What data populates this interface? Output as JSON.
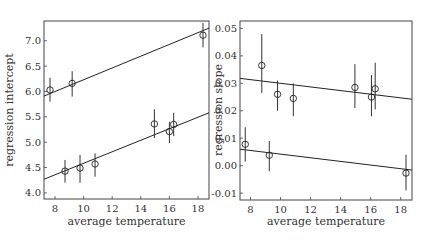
{
  "chart_data": [
    {
      "type": "scatter",
      "title": "",
      "xlabel": "average temperature",
      "ylabel": "regression intercept",
      "xlim": [
        7.23,
        18.77
      ],
      "ylim": [
        3.88,
        7.39
      ],
      "xticks": [
        8,
        10,
        12,
        14,
        16,
        18
      ],
      "yticks": [
        4.0,
        4.5,
        5.0,
        5.5,
        6.0,
        6.5,
        7.0
      ],
      "ytick_labels": [
        "4.0",
        "4.5",
        "5.0",
        "5.5",
        "6.0",
        "6.5",
        "7.0"
      ],
      "grid": false,
      "legend": null,
      "series": [
        {
          "name": "upper group",
          "points": [
            {
              "x": 7.65,
              "y": 6.03,
              "lo": 5.8,
              "hi": 6.27
            },
            {
              "x": 9.2,
              "y": 6.16,
              "lo": 5.9,
              "hi": 6.4
            },
            {
              "x": 18.35,
              "y": 7.11,
              "lo": 6.87,
              "hi": 7.35
            }
          ],
          "fit_line": {
            "x": [
              7.23,
              18.77
            ],
            "y": [
              5.91,
              7.25
            ]
          }
        },
        {
          "name": "lower group",
          "points": [
            {
              "x": 8.7,
              "y": 4.43,
              "lo": 4.2,
              "hi": 4.65
            },
            {
              "x": 9.75,
              "y": 4.49,
              "lo": 4.2,
              "hi": 4.75
            },
            {
              "x": 10.8,
              "y": 4.57,
              "lo": 4.32,
              "hi": 4.78
            },
            {
              "x": 14.95,
              "y": 5.36,
              "lo": 5.08,
              "hi": 5.65
            },
            {
              "x": 16.0,
              "y": 5.21,
              "lo": 4.98,
              "hi": 5.4
            },
            {
              "x": 16.3,
              "y": 5.35,
              "lo": 5.12,
              "hi": 5.58
            }
          ],
          "fit_line": {
            "x": [
              7.23,
              18.77
            ],
            "y": [
              4.27,
              5.58
            ]
          }
        }
      ]
    },
    {
      "type": "scatter",
      "title": "",
      "xlabel": "average temperature",
      "ylabel": "regression slope",
      "xlim": [
        7.3,
        18.75
      ],
      "ylim": [
        -0.0125,
        0.0527
      ],
      "xticks": [
        8,
        10,
        12,
        14,
        16,
        18
      ],
      "yticks": [
        -0.01,
        0.0,
        0.01,
        0.02,
        0.03,
        0.04,
        0.05
      ],
      "ytick_labels": [
        "-0.01",
        "0.00",
        "0.01",
        "0.02",
        "0.03",
        "0.04",
        "0.05"
      ],
      "grid": false,
      "legend": null,
      "series": [
        {
          "name": "upper group",
          "points": [
            {
              "x": 8.75,
              "y": 0.0365,
              "lo": 0.0265,
              "hi": 0.048
            },
            {
              "x": 9.8,
              "y": 0.026,
              "lo": 0.02,
              "hi": 0.031
            },
            {
              "x": 10.85,
              "y": 0.0245,
              "lo": 0.018,
              "hi": 0.03
            },
            {
              "x": 14.95,
              "y": 0.0285,
              "lo": 0.021,
              "hi": 0.037
            },
            {
              "x": 16.05,
              "y": 0.025,
              "lo": 0.018,
              "hi": 0.033
            },
            {
              "x": 16.3,
              "y": 0.028,
              "lo": 0.0205,
              "hi": 0.0375
            }
          ],
          "fit_line": {
            "x": [
              7.3,
              18.75
            ],
            "y": [
              0.0318,
              0.0242
            ]
          }
        },
        {
          "name": "lower group",
          "points": [
            {
              "x": 7.65,
              "y": 0.0078,
              "lo": 0.0015,
              "hi": 0.014
            },
            {
              "x": 9.25,
              "y": 0.0038,
              "lo": -0.002,
              "hi": 0.009
            },
            {
              "x": 18.35,
              "y": -0.0027,
              "lo": -0.009,
              "hi": 0.004
            }
          ],
          "fit_line": {
            "x": [
              7.3,
              18.75
            ],
            "y": [
              0.006,
              -0.0016
            ]
          }
        }
      ]
    }
  ],
  "panels": [
    {
      "xlabel": "average temperature",
      "ylabel": "regression intercept"
    },
    {
      "xlabel": "average temperature",
      "ylabel": "regression slope"
    }
  ]
}
